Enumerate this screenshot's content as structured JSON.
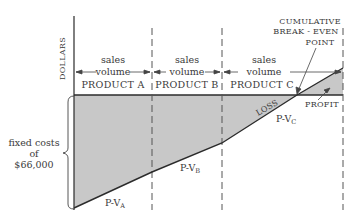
{
  "diagram": {
    "y_axis_label": "DOLLARS",
    "segments": [
      {
        "line1": "sales",
        "line2": "volume",
        "product": "PRODUCT A",
        "line_label": "P-V",
        "line_sub": "A"
      },
      {
        "line1": "sales",
        "line2": "volume",
        "product": "PRODUCT B",
        "line_label": "P-V",
        "line_sub": "B"
      },
      {
        "line1": "sales",
        "line2": "volume",
        "product": "PRODUCT C",
        "line_label": "P-V",
        "line_sub": "C"
      }
    ],
    "fixed_costs": {
      "line1": "fixed costs",
      "line2": "of",
      "line3": "$66,000"
    },
    "break_even": {
      "line1": "CUMULATIVE",
      "line2": "BREAK - EVEN",
      "line3": "POINT"
    },
    "loss_label": "LOSS",
    "profit_label": "PROFIT",
    "colors": {
      "shade": "#c8c8c8",
      "line": "#2b2b2b",
      "text": "#3a3a3a"
    }
  }
}
